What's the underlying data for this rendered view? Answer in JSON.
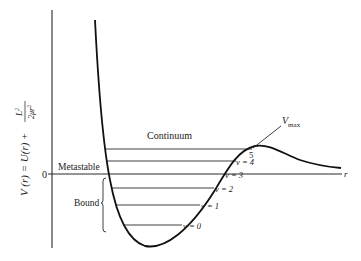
{
  "diagram": {
    "type": "potential-energy-curve",
    "y_axis": {
      "label_main": "V (r) = U(r) + ",
      "label_frac_num": "L",
      "label_frac_num_sup": "2",
      "label_frac_den": "2μr",
      "label_frac_den_sup": "2",
      "zero_label": "0"
    },
    "x_axis": {
      "label": "r"
    },
    "regions": {
      "continuum": "Continuum",
      "metastable": "Metastable",
      "bound": "Bound"
    },
    "peak": {
      "label": "V",
      "label_sub": "max"
    },
    "levels": [
      {
        "v": 0,
        "label": "v = 0"
      },
      {
        "v": 1,
        "label": "v = 1"
      },
      {
        "v": 2,
        "label": "v = 2"
      },
      {
        "v": 3,
        "label": "v = 3"
      },
      {
        "v": 4,
        "label": "v = 4"
      },
      {
        "v": 5,
        "label": "5"
      }
    ],
    "colors": {
      "ink": "#1a1a1a",
      "axis": "#2a2a2a",
      "background": "#ffffff"
    }
  }
}
